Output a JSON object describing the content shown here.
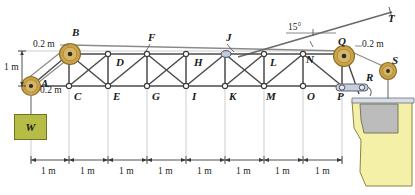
{
  "figure": {
    "type": "statics-truss-diagram",
    "colors": {
      "member": "#4a4a4a",
      "cable": "#6b6b6b",
      "pulley_fill": "#c9a24a",
      "pulley_rim": "#8a6d23",
      "pulley_hub": "#2a2a2a",
      "joint_fill": "#ffffff",
      "joint_stroke": "#3a3a3a",
      "weight_fill": "#b5bd46",
      "weight_stroke": "#6e7520",
      "wall_fill": "#f5f0a8",
      "wall_stroke": "#8a8540",
      "wall_inset": "#b8b8b8",
      "support_bar": "#c6cedd",
      "support_stroke": "#5a6272",
      "dim_line": "#3a3a3a"
    },
    "joints": {
      "top_chord": [
        "B",
        "D",
        "F",
        "H",
        "J",
        "L",
        "N",
        "Q"
      ],
      "bottom_chord": [
        "A",
        "C",
        "E",
        "G",
        "I",
        "K",
        "M",
        "O",
        "P"
      ],
      "other": [
        "R",
        "S",
        "T"
      ]
    },
    "labels": [
      {
        "name": "joint-label-B",
        "text": "B",
        "x": 72,
        "y": 33
      },
      {
        "name": "joint-label-D",
        "text": "D",
        "x": 115,
        "y": 58
      },
      {
        "name": "joint-label-F",
        "text": "F",
        "x": 148,
        "y": 38
      },
      {
        "name": "joint-label-H",
        "text": "H",
        "x": 192,
        "y": 58
      },
      {
        "name": "joint-label-J",
        "text": "J",
        "x": 225,
        "y": 38
      },
      {
        "name": "joint-label-L",
        "text": "L",
        "x": 268,
        "y": 58
      },
      {
        "name": "joint-label-N",
        "text": "N",
        "x": 303,
        "y": 56
      },
      {
        "name": "joint-label-Q",
        "text": "Q",
        "x": 340,
        "y": 41
      },
      {
        "name": "joint-label-A",
        "text": "A",
        "x": 42,
        "y": 82
      },
      {
        "name": "joint-label-C",
        "text": "C",
        "x": 78,
        "y": 98
      },
      {
        "name": "joint-label-E",
        "text": "E",
        "x": 113,
        "y": 98
      },
      {
        "name": "joint-label-G",
        "text": "G",
        "x": 150,
        "y": 98
      },
      {
        "name": "joint-label-I",
        "text": "I",
        "x": 189,
        "y": 98
      },
      {
        "name": "joint-label-K",
        "text": "K",
        "x": 224,
        "y": 98
      },
      {
        "name": "joint-label-M",
        "text": "M",
        "x": 259,
        "y": 98
      },
      {
        "name": "joint-label-O",
        "text": "O",
        "x": 297,
        "y": 98
      },
      {
        "name": "joint-label-P",
        "text": "P",
        "x": 330,
        "y": 98
      },
      {
        "name": "joint-label-R",
        "text": "R",
        "x": 370,
        "y": 76
      },
      {
        "name": "joint-label-S",
        "text": "S",
        "x": 394,
        "y": 61
      },
      {
        "name": "joint-label-T",
        "text": "T",
        "x": 390,
        "y": 14
      }
    ],
    "dimensions": {
      "pulley_b_offset": "0.2 m",
      "pulley_a_offset": "0.2 m",
      "pulley_q_offset": "0.2 m",
      "vertical_height": "1 m",
      "angle": "15°",
      "bay_label": "1 m",
      "bays": [
        "1 m",
        "1 m",
        "1 m",
        "1 m",
        "1 m",
        "1 m",
        "1 m",
        "1 m"
      ]
    },
    "weight": {
      "label": "W"
    }
  }
}
